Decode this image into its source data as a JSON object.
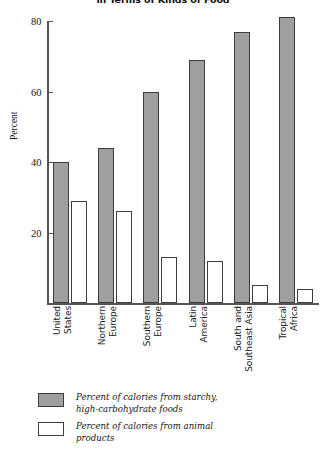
{
  "chart_data": {
    "type": "bar",
    "title": "in Terms of Kinds of Food",
    "xlabel": "",
    "ylabel": "Percent",
    "ylim": [
      0,
      80
    ],
    "yticks": [
      20,
      40,
      60,
      80
    ],
    "grid": false,
    "legend_position": "below-plot",
    "categories": [
      "United States",
      "Northern Europe",
      "Southern Europe",
      "Latin America",
      "South and Southeast Asia",
      "Tropical Africa"
    ],
    "category_lines": [
      [
        "United",
        "States"
      ],
      [
        "Northern",
        "Europe"
      ],
      [
        "Southern",
        "Europe"
      ],
      [
        "Latin",
        "America"
      ],
      [
        "South and",
        "Southeast Asia"
      ],
      [
        "Tropical",
        "Africa"
      ]
    ],
    "series": [
      {
        "name": "Percent of calories from starchy, high-carbohydrate foods",
        "name_lines": [
          "Percent of calories from starchy,",
          "high-carbohydrate foods"
        ],
        "style": "filled",
        "color": "#9f9f9f",
        "values": [
          40,
          44,
          60,
          69,
          77,
          81
        ]
      },
      {
        "name": "Percent of calories from animal products",
        "name_lines": [
          "Percent of calories from animal",
          "products"
        ],
        "style": "hollow",
        "color": "#ffffff",
        "values": [
          29,
          26,
          13,
          12,
          5,
          4
        ]
      }
    ]
  },
  "colors": {
    "filled_bar": "#9f9f9f",
    "hollow_bar": "#ffffff",
    "bar_outline": "#3d3d3d",
    "axis": "#555555",
    "text": "#161616",
    "background": "#ffffff"
  }
}
